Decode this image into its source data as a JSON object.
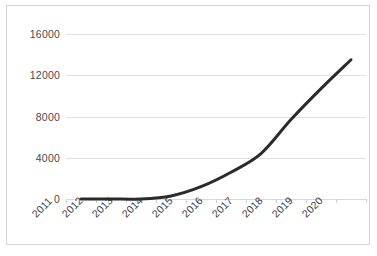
{
  "chart_data": {
    "type": "line",
    "title": "",
    "subtitle": "",
    "xlabel": "",
    "ylabel": "",
    "categories": [
      "2011",
      "2012",
      "2013",
      "2014",
      "2015",
      "2016",
      "2017",
      "2018",
      "2019",
      "2020"
    ],
    "series": [
      {
        "name": "series-1",
        "values": [
          0,
          0,
          0,
          300,
          1200,
          2600,
          4400,
          7700,
          10700,
          13500
        ],
        "color": "#2b2b2b",
        "line_width": 3,
        "markers": false,
        "smooth": true
      }
    ],
    "ylim": [
      0,
      16000
    ],
    "yticks": [
      0,
      4000,
      8000,
      12000,
      16000
    ],
    "ytick_labels": [
      "0",
      "4000",
      "8000",
      "12000",
      "16000"
    ],
    "xtick_label_rotation": -45,
    "grid": {
      "horizontal": true,
      "vertical": false,
      "color": "#e0e0e0"
    },
    "legend": {
      "visible": false,
      "position": "none"
    },
    "plot_border": true,
    "plot_border_color": "#d4d4d4",
    "background": "#ffffff"
  }
}
